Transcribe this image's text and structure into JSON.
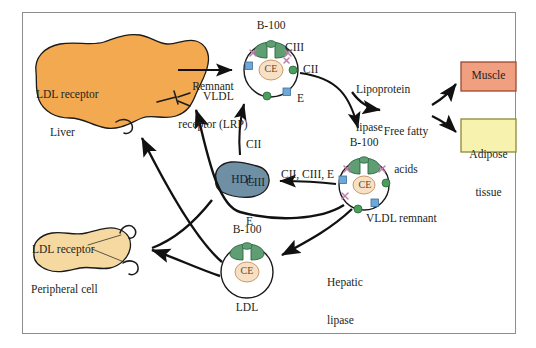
{
  "diagram": {
    "frame": {
      "border_color": "#8d8d8d",
      "background": "#ffffff"
    }
  },
  "organs": {
    "liver": {
      "label": "Liver",
      "receptor_lrp": "Remnant\nreceptor (LRP)",
      "receptor_lrp_line1": "Remnant",
      "receptor_lrp_line2": "receptor (LRP)",
      "receptor_ldl": "LDL receptor",
      "fill": "#f2a94f",
      "stroke": "#1a1a1a"
    },
    "peripheral_cell": {
      "label": "Peripheral cell",
      "receptor_ldl": "LDL receptor",
      "fill": "#f5d9a0",
      "stroke": "#1a1a1a"
    },
    "muscle": {
      "label": "Muscle",
      "fill": "#f0a080",
      "stroke": "#9c4a30"
    },
    "adipose": {
      "label_line1": "Adipose",
      "label_line2": "tissue",
      "fill": "#f7f2ad",
      "stroke": "#8a8a35"
    }
  },
  "particles": {
    "vldl": {
      "name": "VLDL",
      "apob": "B-100",
      "core": "CE",
      "apo_ciii": "CIII",
      "apo_cii": "CII",
      "apo_e": "E",
      "shell_stroke": "#1a1a1a",
      "core_fill": "#f7e0c4",
      "apob_fill": "#5e9e72",
      "cii_fill": "#4aa05a",
      "e_fill": "#6fa8d6",
      "ciii_color": "#c07fa8"
    },
    "vldl_remnant": {
      "name": "VLDL remnant",
      "apob": "B-100",
      "core": "CE"
    },
    "ldl": {
      "name": "LDL",
      "apob": "B-100",
      "core": "CE"
    },
    "hdl": {
      "name": "HDL",
      "fill": "#6e8fa4",
      "stroke": "#1a1a1a"
    }
  },
  "enzymes": {
    "lipoprotein_lipase_line1": "Lipoprotein",
    "lipoprotein_lipase_line2": "lipase",
    "hepatic_lipase_line1": "Hepatic",
    "hepatic_lipase_line2": "lipase"
  },
  "metabolites": {
    "free_fatty_acids_line1": "Free fatty",
    "free_fatty_acids_line2": "acids"
  },
  "transfers": {
    "hdl_to_vldl_1": "CII",
    "hdl_to_vldl_2": "CIII",
    "hdl_to_vldl_3": "E",
    "remnant_to_hdl": "CII, CIII, E"
  }
}
